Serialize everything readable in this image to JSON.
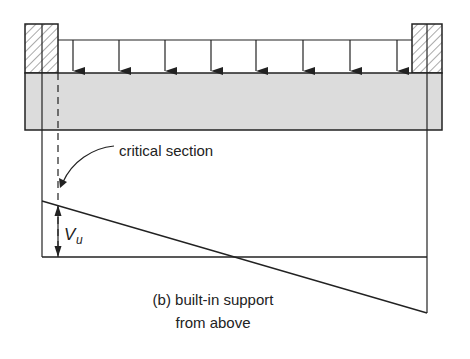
{
  "diagram": {
    "caption_line1": "(b) built-in support",
    "caption_line2": "from above",
    "critical_section_label": "critical section",
    "shear_label_main": "V",
    "shear_label_sub": "u",
    "load": {
      "type": "uniform distributed load",
      "arrow_count": 8
    },
    "supports": [
      "left wall (hatched)",
      "right wall (hatched)"
    ],
    "colors": {
      "line": "#222222",
      "beam_fill": "#dcdcdc",
      "hatch": "#555555",
      "background": "#ffffff"
    }
  }
}
